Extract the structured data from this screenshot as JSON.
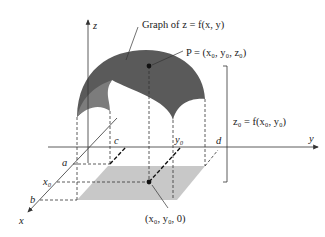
{
  "diagram": {
    "title": "Graph of z = f(x, y)",
    "axes": {
      "z": "z",
      "y": "y",
      "x": "x"
    },
    "point_P": "P = (x₀, y₀, z₀)",
    "point_base": "(x₀, y₀, 0)",
    "height_label": "z₀ = f(x₀, y₀)",
    "ticks": {
      "a": "a",
      "b": "b",
      "x0": "x₀",
      "c": "c",
      "y0": "y₀",
      "d": "d"
    },
    "colors": {
      "surface": "#5a5a5a",
      "surface_inner": "#8a8a8a",
      "region": "#c8c8c8",
      "axis": "#333333"
    }
  }
}
